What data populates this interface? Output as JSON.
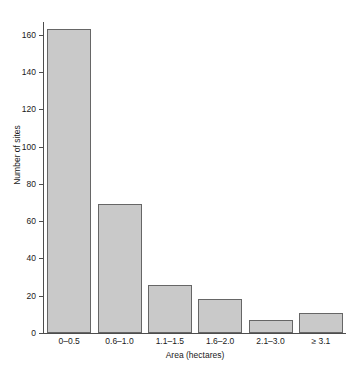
{
  "chart_data": {
    "type": "bar",
    "title": "",
    "subtitle": "",
    "xlabel": "Area (hectares)",
    "ylabel": "Number of sites",
    "categories": [
      "0–0.5",
      "0.6–1.0",
      "1.1–1.5",
      "1.6–2.0",
      "2.1–3.0",
      "≥ 3.1"
    ],
    "values": [
      163,
      69,
      26,
      18,
      7,
      11
    ],
    "ylim": [
      0,
      168
    ],
    "yticks": [
      0,
      20,
      40,
      60,
      80,
      100,
      120,
      140,
      160
    ],
    "ytick_labels": [
      "0",
      "20",
      "40",
      "60",
      "80",
      "100",
      "120",
      "140",
      "160"
    ],
    "grid": false,
    "legend": false,
    "legend_position": "none",
    "bar_fill_color": "#c9c9c9",
    "bar_edge_color": "#666666",
    "axis_color": "#4d4d4d",
    "text_color": "#1a1a1a",
    "background_color": "#ffffff"
  }
}
